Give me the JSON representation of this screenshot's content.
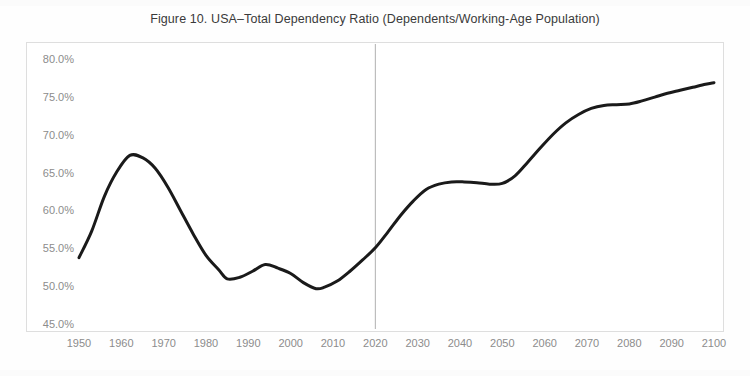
{
  "figure": {
    "title": "Figure 10. USA–Total Dependency Ratio (Dependents/Working-Age Population)"
  },
  "chart_data": {
    "type": "line",
    "title": "Figure 10. USA–Total Dependency Ratio (Dependents/Working-Age Population)",
    "xlabel": "",
    "ylabel": "",
    "xlim": [
      1950,
      2100
    ],
    "ylim": [
      45.0,
      80.0
    ],
    "grid": false,
    "legend": null,
    "y_tick_labels": [
      "80.0%",
      "75.0%",
      "70.0%",
      "65.0%",
      "60.0%",
      "55.0%",
      "50.0%",
      "45.0%"
    ],
    "y_tick_values": [
      80.0,
      75.0,
      70.0,
      65.0,
      60.0,
      55.0,
      50.0,
      45.0
    ],
    "x_tick_labels": [
      "1950",
      "1960",
      "1970",
      "1980",
      "1990",
      "2000",
      "2010",
      "2020",
      "2030",
      "2040",
      "2050",
      "2060",
      "2070",
      "2080",
      "2090",
      "2100"
    ],
    "x_tick_values": [
      1950,
      1960,
      1970,
      1980,
      1990,
      2000,
      2010,
      2020,
      2030,
      2040,
      2050,
      2060,
      2070,
      2080,
      2090,
      2100
    ],
    "annotations": [
      {
        "type": "vline",
        "x": 2020,
        "label": "",
        "color": "#b0b0b0"
      }
    ],
    "series": [
      {
        "name": "USA Total Dependency Ratio",
        "color": "#1a1a1a",
        "x": [
          1950,
          1953,
          1956,
          1959,
          1962,
          1965,
          1968,
          1971,
          1974,
          1977,
          1980,
          1983,
          1985,
          1988,
          1991,
          1994,
          1997,
          2000,
          2003,
          2006,
          2008,
          2011,
          2014,
          2017,
          2020,
          2023,
          2026,
          2029,
          2032,
          2035,
          2038,
          2041,
          2044,
          2047,
          2050,
          2053,
          2056,
          2059,
          2062,
          2065,
          2068,
          2071,
          2074,
          2077,
          2080,
          2083,
          2086,
          2089,
          2092,
          2095,
          2098,
          2100
        ],
        "y": [
          53.9,
          57.4,
          62.0,
          65.3,
          67.4,
          67.1,
          65.7,
          63.2,
          60.1,
          57.0,
          54.2,
          52.3,
          51.1,
          51.3,
          52.1,
          53.0,
          52.5,
          51.8,
          50.6,
          49.8,
          50.0,
          50.8,
          52.1,
          53.6,
          55.2,
          57.3,
          59.5,
          61.4,
          62.9,
          63.6,
          63.9,
          63.9,
          63.8,
          63.6,
          63.7,
          64.7,
          66.5,
          68.4,
          70.2,
          71.7,
          72.8,
          73.6,
          74.0,
          74.1,
          74.2,
          74.6,
          75.1,
          75.6,
          76.0,
          76.4,
          76.8,
          77.0
        ]
      }
    ]
  }
}
